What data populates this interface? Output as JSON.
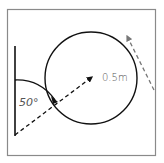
{
  "diagram": {
    "labels": {
      "angle": "50°",
      "radius": "0.5m"
    },
    "colors": {
      "frame": "#8a8a8a",
      "stroke": "#111111",
      "label": "#555555",
      "exit_arrow": "#777777"
    },
    "elements": [
      "vertical-wall",
      "curved-ramp",
      "loop-circle",
      "launch-direction-arrow",
      "exit-direction-arrow"
    ]
  }
}
